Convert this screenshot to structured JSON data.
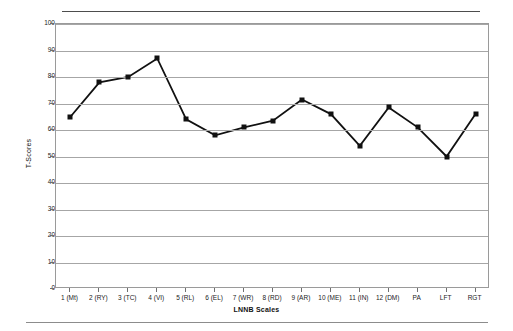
{
  "chart_data": {
    "type": "line",
    "title": "",
    "xlabel": "LNNB Scales",
    "ylabel": "T-Scores",
    "ylim": [
      0,
      100
    ],
    "ytick_step": 10,
    "yticks": [
      100,
      90,
      80,
      70,
      60,
      50,
      40,
      30,
      20,
      10,
      0
    ],
    "grid": true,
    "legend": "none",
    "marker": "square",
    "series_color": "#111111",
    "categories": [
      "1 (Mt)",
      "2 (RY)",
      "3 (TC)",
      "4 (VI)",
      "5 (RL)",
      "6 (EL)",
      "7 (WR)",
      "8 (RD)",
      "9 (AR)",
      "10 (ME)",
      "11 (IN)",
      "12 (DM)",
      "PA",
      "LFT",
      "RGT"
    ],
    "values": [
      65,
      78,
      80,
      87,
      64,
      58,
      61,
      63.5,
      71.5,
      66,
      54,
      68.5,
      61,
      50,
      66
    ]
  }
}
